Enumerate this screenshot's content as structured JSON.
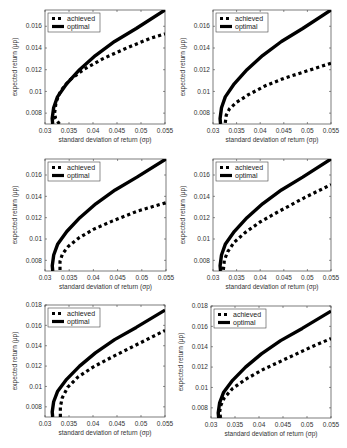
{
  "chart_data": [
    {
      "type": "line",
      "panel": "top-left",
      "xlabel": "standard deviation of return (σp)",
      "ylabel": "expected return (μp)",
      "xlim": [
        0.03,
        0.055
      ],
      "ylim": [
        0.007,
        0.0175
      ],
      "xticks": [
        "0.03",
        "0.035",
        "0.04",
        "0.045",
        "0.05",
        "0.055"
      ],
      "yticks": [
        "0.008",
        "0.01",
        "0.012",
        "0.014",
        "0.016"
      ],
      "legend": [
        "achieved",
        "optimal"
      ],
      "legend_position": "upper left",
      "grid": false,
      "series": [
        {
          "name": "achieved",
          "style": "dotted",
          "x": [
            0.033,
            0.0322,
            0.032,
            0.0323,
            0.0332,
            0.035,
            0.038,
            0.042,
            0.047,
            0.052,
            0.055
          ],
          "y": [
            0.007,
            0.0075,
            0.008,
            0.009,
            0.01,
            0.011,
            0.012,
            0.013,
            0.014,
            0.0149,
            0.0153
          ]
        },
        {
          "name": "optimal",
          "style": "solid",
          "x": [
            0.0316,
            0.0315,
            0.0318,
            0.0326,
            0.0345,
            0.0372,
            0.0405,
            0.0445,
            0.049,
            0.055
          ],
          "y": [
            0.007,
            0.0075,
            0.0085,
            0.0095,
            0.0107,
            0.012,
            0.0133,
            0.0146,
            0.0158,
            0.0175
          ]
        }
      ]
    },
    {
      "type": "line",
      "panel": "top-right",
      "xlabel": "standard deviation of return (σp)",
      "ylabel": "expected return (μp)",
      "xlim": [
        0.03,
        0.055
      ],
      "ylim": [
        0.007,
        0.0175
      ],
      "xticks": [
        "0.03",
        "0.035",
        "0.04",
        "0.045",
        "0.05",
        "0.055"
      ],
      "yticks": [
        "0.008",
        "0.01",
        "0.012",
        "0.014",
        "0.016"
      ],
      "legend": [
        "achieved",
        "optimal"
      ],
      "legend_position": "upper left",
      "grid": false,
      "series": [
        {
          "name": "achieved",
          "style": "dotted",
          "x": [
            0.0326,
            0.0328,
            0.0335,
            0.035,
            0.0375,
            0.041,
            0.045,
            0.05,
            0.055
          ],
          "y": [
            0.0071,
            0.0078,
            0.0084,
            0.009,
            0.0097,
            0.0105,
            0.0112,
            0.0119,
            0.0126
          ]
        },
        {
          "name": "optimal",
          "style": "solid",
          "x": [
            0.0316,
            0.0315,
            0.0318,
            0.0326,
            0.0345,
            0.0372,
            0.0405,
            0.0445,
            0.049,
            0.055
          ],
          "y": [
            0.007,
            0.0075,
            0.0085,
            0.0095,
            0.0107,
            0.012,
            0.0133,
            0.0146,
            0.0158,
            0.0175
          ]
        }
      ]
    },
    {
      "type": "line",
      "panel": "middle-left",
      "xlabel": "standard deviation of return (σp)",
      "ylabel": "expected return (μp)",
      "xlim": [
        0.03,
        0.055
      ],
      "ylim": [
        0.007,
        0.0175
      ],
      "xticks": [
        "0.03",
        "0.035",
        "0.04",
        "0.045",
        "0.05",
        "0.055"
      ],
      "yticks": [
        "0.008",
        "0.01",
        "0.012",
        "0.014",
        "0.016"
      ],
      "legend": [
        "achieved",
        "optimal"
      ],
      "legend_position": "upper left",
      "grid": false,
      "series": [
        {
          "name": "achieved",
          "style": "dotted",
          "x": [
            0.0331,
            0.0331,
            0.0336,
            0.0348,
            0.037,
            0.04,
            0.044,
            0.049,
            0.055
          ],
          "y": [
            0.0071,
            0.0079,
            0.0086,
            0.0093,
            0.0101,
            0.0109,
            0.0117,
            0.0126,
            0.0134
          ]
        },
        {
          "name": "optimal",
          "style": "solid",
          "x": [
            0.0316,
            0.0315,
            0.0318,
            0.0326,
            0.0345,
            0.0372,
            0.0405,
            0.0445,
            0.049,
            0.055
          ],
          "y": [
            0.007,
            0.0075,
            0.0085,
            0.0095,
            0.0107,
            0.012,
            0.0133,
            0.0146,
            0.0158,
            0.0175
          ]
        }
      ]
    },
    {
      "type": "line",
      "panel": "middle-right",
      "xlabel": "standard deviation of return (σp)",
      "ylabel": "expected return (μp)",
      "xlim": [
        0.03,
        0.055
      ],
      "ylim": [
        0.007,
        0.0175
      ],
      "xticks": [
        "0.03",
        "0.035",
        "0.04",
        "0.045",
        "0.05",
        "0.055"
      ],
      "yticks": [
        "0.008",
        "0.01",
        "0.012",
        "0.014",
        "0.016"
      ],
      "legend": [
        "achieved",
        "optimal"
      ],
      "legend_position": "upper left",
      "grid": false,
      "series": [
        {
          "name": "achieved",
          "style": "dotted",
          "x": [
            0.0322,
            0.0324,
            0.0331,
            0.0345,
            0.0368,
            0.04,
            0.044,
            0.0495,
            0.055
          ],
          "y": [
            0.0071,
            0.008,
            0.0088,
            0.0097,
            0.0106,
            0.0116,
            0.0126,
            0.0139,
            0.0151
          ]
        },
        {
          "name": "optimal",
          "style": "solid",
          "x": [
            0.0316,
            0.0315,
            0.0318,
            0.0326,
            0.0345,
            0.0372,
            0.0405,
            0.0445,
            0.049,
            0.055
          ],
          "y": [
            0.007,
            0.0075,
            0.0085,
            0.0095,
            0.0107,
            0.012,
            0.0133,
            0.0146,
            0.0158,
            0.0175
          ]
        }
      ]
    },
    {
      "type": "line",
      "panel": "bottom-left",
      "xlabel": "standard deviation of return (σp)",
      "ylabel": "expected return (μp)",
      "xlim": [
        0.03,
        0.055
      ],
      "ylim": [
        0.007,
        0.018
      ],
      "xticks": [
        "0.03",
        "0.035",
        "0.04",
        "0.045",
        "0.05",
        "0.055"
      ],
      "yticks": [
        "0.008",
        "0.01",
        "0.012",
        "0.014",
        "0.016",
        "0.018"
      ],
      "legend": [
        "achieved",
        "optimal"
      ],
      "legend_position": "upper left",
      "grid": false,
      "series": [
        {
          "name": "achieved",
          "style": "dotted",
          "x": [
            0.0332,
            0.0332,
            0.0336,
            0.0347,
            0.0368,
            0.04,
            0.044,
            0.0495,
            0.055
          ],
          "y": [
            0.007,
            0.008,
            0.0089,
            0.0099,
            0.0109,
            0.0119,
            0.0129,
            0.0142,
            0.0155
          ]
        },
        {
          "name": "optimal",
          "style": "solid",
          "x": [
            0.0316,
            0.0315,
            0.0318,
            0.0326,
            0.0345,
            0.0372,
            0.0405,
            0.0445,
            0.049,
            0.055
          ],
          "y": [
            0.007,
            0.0075,
            0.0085,
            0.0095,
            0.0107,
            0.012,
            0.0133,
            0.0146,
            0.0158,
            0.0175
          ]
        }
      ]
    },
    {
      "type": "line",
      "panel": "bottom-right",
      "xlabel": "standard deviation of return (σp)",
      "ylabel": "expected return (μp)",
      "xlim": [
        0.03,
        0.055
      ],
      "ylim": [
        0.007,
        0.018
      ],
      "xticks": [
        "0.03",
        "0.035",
        "0.04",
        "0.045",
        "0.05",
        "0.055"
      ],
      "yticks": [
        "0.008",
        "0.01",
        "0.012",
        "0.014",
        "0.016",
        "0.018"
      ],
      "legend": [
        "achieved",
        "optimal"
      ],
      "legend_position": "upper left",
      "grid": false,
      "series": [
        {
          "name": "achieved",
          "style": "dotted",
          "x": [
            0.032,
            0.0318,
            0.032,
            0.0328,
            0.0345,
            0.0372,
            0.041,
            0.046,
            0.051,
            0.055
          ],
          "y": [
            0.007,
            0.0076,
            0.0082,
            0.009,
            0.0099,
            0.0108,
            0.0118,
            0.0129,
            0.014,
            0.0148
          ]
        },
        {
          "name": "optimal",
          "style": "solid",
          "x": [
            0.0316,
            0.0315,
            0.0318,
            0.0326,
            0.0345,
            0.0372,
            0.0405,
            0.0445,
            0.049,
            0.055
          ],
          "y": [
            0.007,
            0.0075,
            0.0085,
            0.0095,
            0.0107,
            0.012,
            0.0133,
            0.0146,
            0.0158,
            0.0175
          ]
        }
      ]
    }
  ],
  "layout": {
    "panels": [
      {
        "box": [
          45,
          10,
          165,
          124
        ]
      },
      {
        "box": [
          213,
          10,
          331,
          124
        ]
      },
      {
        "box": [
          45,
          159,
          166,
          271
        ]
      },
      {
        "box": [
          213,
          159,
          331,
          271
        ]
      },
      {
        "box": [
          45,
          305,
          165,
          417
        ]
      },
      {
        "box": [
          211,
          306,
          331,
          418
        ]
      }
    ]
  }
}
